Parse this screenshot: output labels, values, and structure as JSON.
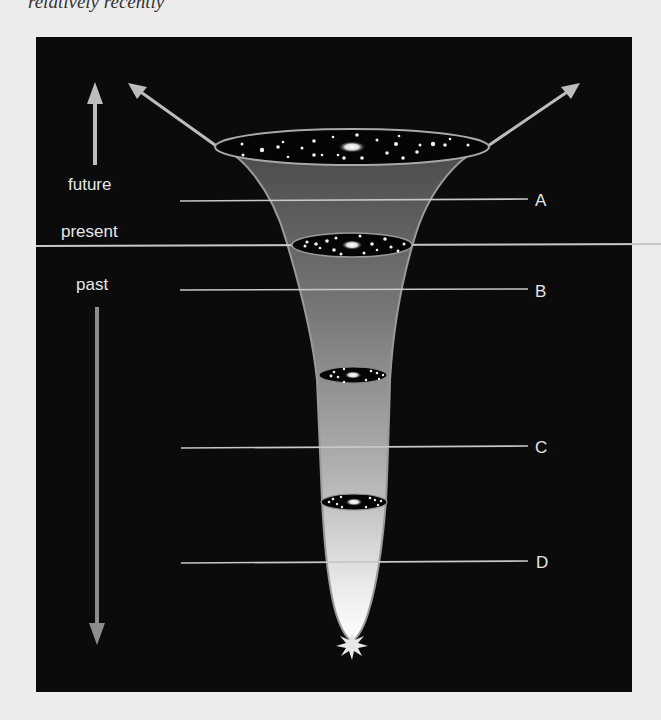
{
  "caption_fragment": "relatively  recently",
  "diagram": {
    "time_labels": {
      "future": "future",
      "present": "present",
      "past": "past"
    },
    "epoch_markers": [
      {
        "id": "A",
        "label": "A"
      },
      {
        "id": "B",
        "label": "B"
      },
      {
        "id": "C",
        "label": "C"
      },
      {
        "id": "D",
        "label": "D"
      }
    ],
    "colors": {
      "background": "#0b0b0b",
      "funnel_top": "#555555",
      "funnel_bottom": "#f2f2f2",
      "lines": "#c8c8c8",
      "text": "#e6e6e6",
      "page": "#ececec"
    }
  }
}
